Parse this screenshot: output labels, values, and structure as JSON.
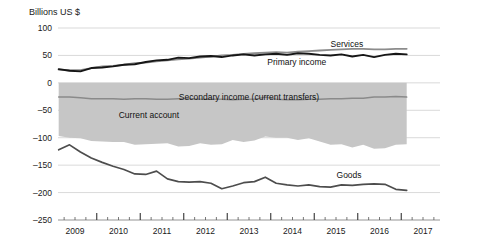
{
  "chart_data": {
    "type": "line",
    "title": "",
    "ylabel": "Billions US $",
    "xlabel": "",
    "ylim": [
      -250,
      100
    ],
    "yticks": [
      100,
      50,
      0,
      -50,
      -100,
      -150,
      -200,
      -250
    ],
    "ytick_labels": [
      "100",
      "50",
      "0",
      "–50",
      "–100",
      "–150",
      "–200",
      "–250"
    ],
    "xlim": [
      2008.5,
      2017.25
    ],
    "xticks": [
      2009,
      2010,
      2011,
      2012,
      2013,
      2014,
      2015,
      2016,
      2017
    ],
    "xtick_labels": [
      "2009",
      "2010",
      "2011",
      "2012",
      "2013",
      "2014",
      "2015",
      "2016",
      "2017"
    ],
    "x_tick_interval": "quarterly",
    "grid": "horizontal",
    "legend_position": "inline-annotations",
    "annotations": [
      {
        "text": "Services",
        "x": 2015.25,
        "y": 66
      },
      {
        "text": "Primary income",
        "x": 2014.1,
        "y": 33
      },
      {
        "text": "Secondary income (current transfers)",
        "x": 2013.0,
        "y": -31
      },
      {
        "text": "Current account",
        "x": 2010.7,
        "y": -64
      },
      {
        "text": "Goods",
        "x": 2015.3,
        "y": -174
      }
    ],
    "x": [
      2008.625,
      2008.875,
      2009.125,
      2009.375,
      2009.625,
      2009.875,
      2010.125,
      2010.375,
      2010.625,
      2010.875,
      2011.125,
      2011.375,
      2011.625,
      2011.875,
      2012.125,
      2012.375,
      2012.625,
      2012.875,
      2013.125,
      2013.375,
      2013.625,
      2013.875,
      2014.125,
      2014.375,
      2014.625,
      2014.875,
      2015.125,
      2015.375,
      2015.625,
      2015.875,
      2016.125,
      2016.375,
      2016.625
    ],
    "series": [
      {
        "name": "Services",
        "color": "#8c8c8c",
        "values": [
          24,
          23,
          23,
          27,
          30,
          31,
          33,
          36,
          37,
          39,
          41,
          43,
          44,
          46,
          48,
          50,
          51,
          53,
          54,
          55,
          56,
          55,
          57,
          58,
          59,
          60,
          61,
          62,
          62,
          61,
          61,
          62,
          62
        ]
      },
      {
        "name": "Primary income",
        "color": "#161616",
        "values": [
          25,
          22,
          21,
          27,
          28,
          30,
          33,
          34,
          38,
          41,
          42,
          46,
          45,
          48,
          49,
          47,
          50,
          52,
          50,
          52,
          53,
          51,
          54,
          53,
          51,
          50,
          52,
          48,
          51,
          47,
          51,
          53,
          52
        ]
      },
      {
        "name": "Secondary income (current transfers)",
        "color": "#8a8a8a",
        "values": [
          -26,
          -26,
          -27,
          -29,
          -29,
          -29,
          -30,
          -29,
          -29,
          -30,
          -30,
          -29,
          -29,
          -30,
          -30,
          -30,
          -31,
          -30,
          -30,
          -26,
          -30,
          -31,
          -31,
          -30,
          -30,
          -29,
          -29,
          -28,
          -28,
          -26,
          -26,
          -25,
          -26
        ]
      },
      {
        "name": "Current account",
        "color": "#c6c6c6",
        "values": [
          -97,
          -100,
          -101,
          -106,
          -107,
          -108,
          -108,
          -113,
          -112,
          -111,
          -110,
          -116,
          -115,
          -110,
          -113,
          -112,
          -104,
          -108,
          -105,
          -98,
          -100,
          -100,
          -104,
          -101,
          -107,
          -113,
          -112,
          -118,
          -113,
          -120,
          -119,
          -113,
          -112
        ]
      },
      {
        "name": "Goods",
        "color": "#4d4d4d",
        "values": [
          -122,
          -113,
          -126,
          -137,
          -145,
          -152,
          -158,
          -166,
          -167,
          -161,
          -175,
          -180,
          -181,
          -180,
          -183,
          -193,
          -188,
          -182,
          -180,
          -172,
          -183,
          -186,
          -188,
          -186,
          -189,
          -190,
          -186,
          -187,
          -185,
          -184,
          -185,
          -194,
          -196
        ]
      }
    ]
  }
}
